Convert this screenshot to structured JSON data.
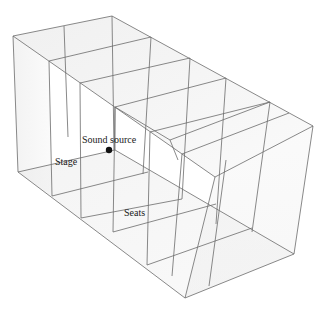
{
  "diagram": {
    "type": "3d-wireframe-box",
    "labels": {
      "sound_source": "Sound source",
      "stage": "Stage",
      "seats": "Seats"
    },
    "colors": {
      "line": "#6b6b6b",
      "face_fill": "#ececec",
      "source_dot": "#111111",
      "background": "#ffffff"
    },
    "sections": 5
  }
}
